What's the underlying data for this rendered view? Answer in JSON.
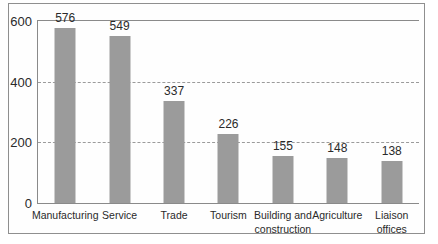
{
  "chart_data": {
    "type": "bar",
    "title": "",
    "xlabel": "",
    "ylabel": "",
    "categories": [
      "Manufacturing",
      "Service",
      "Trade",
      "Tourism",
      "Building and\nconstruction",
      "Agriculture",
      "Liaison\noffices"
    ],
    "values": [
      576,
      549,
      337,
      226,
      155,
      148,
      138
    ],
    "value_labels": [
      "576",
      "549",
      "337",
      "226",
      "155",
      "148",
      "138"
    ],
    "yticks": [
      600,
      400,
      200,
      0
    ],
    "ylim": [
      0,
      600
    ],
    "grid": "horizontal dashed lines at 200 and 400",
    "legend_position": "none",
    "bar_color": "#9b9b9b"
  },
  "colors": {
    "bar": "#9b9b9b",
    "axis_line": "#8a8a8a",
    "gridline": "#9b9b9b",
    "figure_border": "#8f8f8f",
    "text": "#2a2a2a",
    "background": "#ffffff"
  }
}
